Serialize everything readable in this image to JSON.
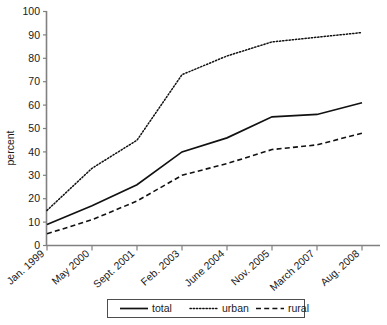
{
  "chart_data": {
    "type": "line",
    "title": "",
    "xlabel": "",
    "ylabel": "percent",
    "ylim": [
      0,
      100
    ],
    "ytick_step": 10,
    "yticks": [
      0,
      10,
      20,
      30,
      40,
      50,
      60,
      70,
      80,
      90,
      100
    ],
    "grid": false,
    "legend_position": "bottom-center",
    "categories": [
      "Jan. 1999",
      "May 2000",
      "Sept. 2001",
      "Feb. 2003",
      "June 2004",
      "Nov. 2005",
      "March 2007",
      "Aug. 2008"
    ],
    "series": [
      {
        "name": "total",
        "style": "solid",
        "values": [
          9,
          17,
          26,
          40,
          46,
          55,
          56,
          61
        ]
      },
      {
        "name": "urban",
        "style": "dotted",
        "values": [
          15,
          33,
          45,
          73,
          81,
          87,
          89,
          91
        ]
      },
      {
        "name": "rural",
        "style": "dashed",
        "values": [
          5,
          11,
          19,
          30,
          35,
          41,
          43,
          48
        ]
      }
    ]
  },
  "axes": {
    "y_title": "percent",
    "y_tick_labels": [
      "0",
      "10",
      "20",
      "30",
      "40",
      "50",
      "60",
      "70",
      "80",
      "90",
      "100"
    ],
    "x_tick_labels": [
      "Jan. 1999",
      "May 2000",
      "Sept. 2001",
      "Feb. 2003",
      "June 2004",
      "Nov. 2005",
      "March 2007",
      "Aug. 2008"
    ]
  },
  "legend": {
    "items": [
      {
        "label": "total",
        "style": "solid"
      },
      {
        "label": "urban",
        "style": "dotted"
      },
      {
        "label": "rural",
        "style": "dashed"
      }
    ]
  }
}
